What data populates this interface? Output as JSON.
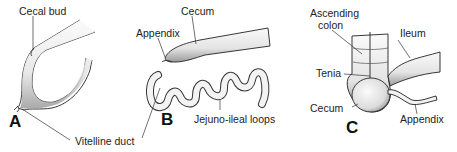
{
  "figure": {
    "panels": [
      {
        "id": "A",
        "letter": "A",
        "labels": {
          "cecal_bud": "Cecal bud",
          "vitelline_duct": "Vitelline duct"
        }
      },
      {
        "id": "B",
        "letter": "B",
        "labels": {
          "cecum": "Cecum",
          "appendix": "Appendix",
          "jejuno_ileal": "Jejuno-ileal loops"
        }
      },
      {
        "id": "C",
        "letter": "C",
        "labels": {
          "ascending_colon_1": "Ascending",
          "ascending_colon_2": "colon",
          "ileum": "Ileum",
          "tenia": "Tenia",
          "cecum": "Cecum",
          "appendix": "Appendix"
        }
      }
    ]
  }
}
